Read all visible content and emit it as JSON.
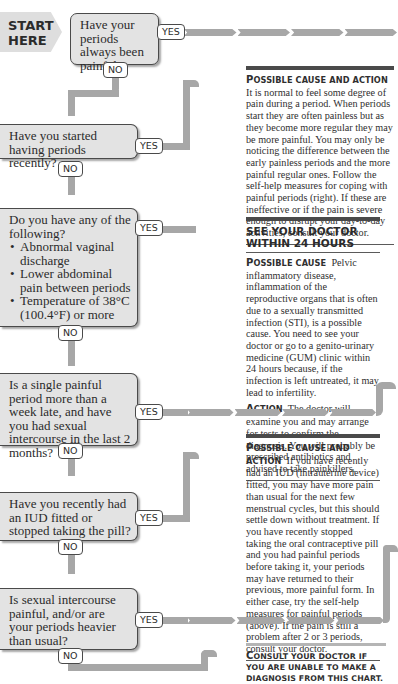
{
  "start": {
    "line1": "START",
    "line2": "HERE"
  },
  "questions": [
    {
      "id": "q1",
      "text": "Have your periods always been painful?",
      "yes": "YES",
      "no": "NO"
    },
    {
      "id": "q2",
      "text": "Have you started having periods recently?",
      "yes": "YES",
      "no": "NO"
    },
    {
      "id": "q3",
      "text": "Do you have any of the following?",
      "bullets": [
        "Abnormal vaginal discharge",
        "Lower abdominal pain between periods",
        "Temperature of 38°C (100.4°F) or more"
      ],
      "yes": "YES",
      "no": "NO"
    },
    {
      "id": "q4",
      "text": "Is a single painful period more than a week late, and have you had sexual intercourse in the last 2 months?",
      "yes": "YES",
      "no": "NO"
    },
    {
      "id": "q5",
      "text": "Have you recently had an IUD fitted or stopped taking the pill?",
      "yes": "YES",
      "no": "NO"
    },
    {
      "id": "q6",
      "text": "Is sexual intercourse painful, and/or are your periods heavier than usual?",
      "yes": "YES",
      "no": "NO"
    }
  ],
  "panels": {
    "p1": {
      "label_cap": "P",
      "label_rest": "OSSIBLE CAUSE AND ACTION",
      "text": "It is normal to feel some degree of pain during a period. When periods start they are often painless but as they become more regular they may be more painful. You may only be noticing the difference between the early painless periods and the more painful regular ones. Follow the self-help measures for coping with painful periods (right). If these are ineffective or if the pain is severe enough to disrupt your day-to-day activities, consult your doctor."
    },
    "p2": {
      "heading": "SEE YOUR DOCTOR WITHIN 24 HOURS",
      "cause_cap": "P",
      "cause_rest": "OSSIBLE CAUSE",
      "cause_text": "Pelvic inflammatory disease, inflammation of the reproductive organs that is often due to a sexually transmitted infection (STI), is a possible cause. You need to see your doctor or go to a genito-urinary medicine (GUM) clinic within 24 hours because, if the infection is left untreated, it may lead to infertility.",
      "action_cap": "A",
      "action_rest": "CTION",
      "action_text": "The doctor will examine you and may arrange for tests to confirm the diagnosis. You will probably be prescribed antibiotics and advised to take painkillers."
    },
    "p3": {
      "label_cap": "P",
      "label_rest": "OSSIBLE CAUSE AND ACTION",
      "text": "If you have recently had an IUD (intrauterine device) fitted, you may have more pain than usual for the next few menstrual cycles, but this should settle down without treatment. If you have recently stopped taking the oral contraceptive pill and you had painful periods before taking it, your periods may have returned to their previous, more painful form. In either case, try the self-help measures for painful periods (above). If the pain is still a problem after 2 or 3 periods, consult your doctor."
    },
    "p4": {
      "cap": "C",
      "rest": "ONSULT YOUR DOCTOR IF YOU ARE UNABLE TO MAKE A DIAGNOSIS FROM THIS CHART."
    }
  },
  "colors": {
    "pipe": "#a7a7a7",
    "box_fill": "#e3e3e3",
    "border": "#4a4a4a"
  }
}
